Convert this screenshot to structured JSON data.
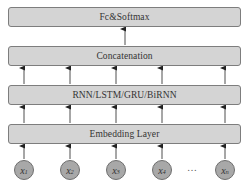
{
  "diagram": {
    "layers": [
      {
        "id": "fc",
        "label": "Fc&Softmax",
        "top": 7
      },
      {
        "id": "concat",
        "label": "Concatenation",
        "top": 46
      },
      {
        "id": "rnn",
        "label": "RNN/LSTM/GRU/BiRNN",
        "top": 85
      },
      {
        "id": "embed",
        "label": "Embedding Layer",
        "top": 124
      }
    ],
    "inputs": [
      {
        "var": "x",
        "sub": "1",
        "cx": 24
      },
      {
        "var": "x",
        "sub": "2",
        "cx": 70
      },
      {
        "var": "x",
        "sub": "3",
        "cx": 116
      },
      {
        "var": "x",
        "sub": "4",
        "cx": 162
      },
      {
        "var": "x",
        "sub": "n",
        "cx": 225
      }
    ],
    "ellipsis": "…",
    "colors": {
      "box_fill": "#d4d4d4",
      "box_border": "#7d7d7d",
      "node_fill": "#a8a8a8",
      "arrow": "#222222"
    }
  }
}
